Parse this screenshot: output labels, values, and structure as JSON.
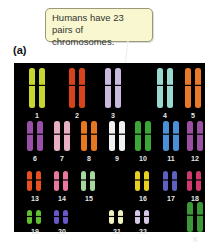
{
  "panel_label": "(a)",
  "callout": {
    "text": "Humans have 23 pairs of chromosomes."
  },
  "karyotype": {
    "background": "#000000",
    "chromosomes": [
      {
        "label": "1",
        "color": "#c8d630",
        "size": "large"
      },
      {
        "label": "2",
        "color": "#d8431c",
        "size": "large"
      },
      {
        "label": "3",
        "color": "#c9b8e0",
        "size": "large"
      },
      {
        "label": "4",
        "color": "#9ad8d0",
        "size": "large"
      },
      {
        "label": "5",
        "color": "#e8782a",
        "size": "large"
      },
      {
        "label": "6",
        "color": "#9a50a8",
        "size": "medium"
      },
      {
        "label": "7",
        "color": "#e8b0c0",
        "size": "medium"
      },
      {
        "label": "8",
        "color": "#e87820",
        "size": "medium"
      },
      {
        "label": "9",
        "color": "#f0f0f0",
        "size": "medium"
      },
      {
        "label": "10",
        "color": "#3aa838",
        "size": "medium"
      },
      {
        "label": "11",
        "color": "#4a90d8",
        "size": "medium"
      },
      {
        "label": "12",
        "color": "#9a50a0",
        "size": "medium"
      },
      {
        "label": "13",
        "color": "#e85020",
        "size": "small"
      },
      {
        "label": "14",
        "color": "#e878a0",
        "size": "small"
      },
      {
        "label": "15",
        "color": "#a8d8a0",
        "size": "small"
      },
      {
        "label": "16",
        "color": "#e8d020",
        "size": "small"
      },
      {
        "label": "17",
        "color": "#6060c0",
        "size": "small"
      },
      {
        "label": "18",
        "color": "#d03870",
        "size": "small"
      },
      {
        "label": "19",
        "color": "#60c030",
        "size": "tiny"
      },
      {
        "label": "20",
        "color": "#6858c8",
        "size": "tiny"
      },
      {
        "label": "21",
        "color": "#f0f0c0",
        "size": "tiny"
      },
      {
        "label": "22",
        "color": "#d8c8e8",
        "size": "tiny"
      },
      {
        "label": "X",
        "color": "#3a9838",
        "size": "medium"
      }
    ]
  }
}
